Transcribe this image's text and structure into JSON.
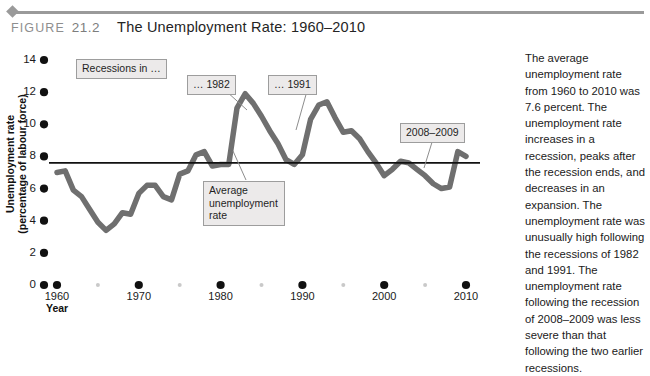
{
  "header": {
    "figure_word": "FIGURE",
    "figure_number": "21.2",
    "title": "The Unemployment Rate: 1960–2010"
  },
  "chart_data": {
    "type": "line",
    "title": "The Unemployment Rate: 1960–2010",
    "xlabel": "Year",
    "ylabel": "Unemployment rate (percentage of labour force)",
    "xlim": [
      1960,
      2010
    ],
    "ylim": [
      0,
      14
    ],
    "grid": false,
    "legend": "none",
    "ytick_labels": [
      "0",
      "2",
      "4",
      "6",
      "8",
      "10",
      "12",
      "14"
    ],
    "ytick_values": [
      0,
      2,
      4,
      6,
      8,
      10,
      12,
      14
    ],
    "xtick_labels": [
      "1960",
      "1970",
      "1980",
      "1990",
      "2000",
      "2010"
    ],
    "xtick_values": [
      1960,
      1970,
      1980,
      1990,
      2000,
      2010
    ],
    "xminor_values": [
      1965,
      1975,
      1985,
      1995,
      2005
    ],
    "series": [
      {
        "name": "Unemployment rate",
        "color": "#6f6f6f",
        "x": [
          1960,
          1961,
          1962,
          1963,
          1964,
          1965,
          1966,
          1967,
          1968,
          1969,
          1970,
          1971,
          1972,
          1973,
          1974,
          1975,
          1976,
          1977,
          1978,
          1979,
          1980,
          1981,
          1982,
          1983,
          1984,
          1985,
          1986,
          1987,
          1988,
          1989,
          1990,
          1991,
          1992,
          1993,
          1994,
          1995,
          1996,
          1997,
          1998,
          1999,
          2000,
          2001,
          2002,
          2003,
          2004,
          2005,
          2006,
          2007,
          2008,
          2009,
          2010
        ],
        "y": [
          7.0,
          7.1,
          5.9,
          5.5,
          4.7,
          3.9,
          3.4,
          3.8,
          4.5,
          4.4,
          5.7,
          6.2,
          6.2,
          5.5,
          5.3,
          6.9,
          7.1,
          8.1,
          8.3,
          7.4,
          7.5,
          7.5,
          11.0,
          11.9,
          11.3,
          10.5,
          9.6,
          8.8,
          7.8,
          7.5,
          8.1,
          10.3,
          11.2,
          11.4,
          10.4,
          9.5,
          9.6,
          9.1,
          8.3,
          7.6,
          6.8,
          7.2,
          7.7,
          7.6,
          7.2,
          6.8,
          6.3,
          6.0,
          6.1,
          8.3,
          8.0
        ],
        "line_width": 5.5
      },
      {
        "name": "Average unemployment rate",
        "color": "#111111",
        "type": "hline",
        "value": 7.6,
        "line_width": 1.6
      }
    ],
    "annotations": [
      {
        "name": "recessions-label",
        "text": "Recessions in …"
      },
      {
        "name": "recession-1982-label",
        "text": "… 1982"
      },
      {
        "name": "recession-1991-label",
        "text": "… 1991"
      },
      {
        "name": "recession-2008-2009-label",
        "text": "2008–2009"
      },
      {
        "name": "average-rate-label",
        "text": "Average unemployment rate"
      }
    ]
  },
  "side_panel": {
    "paragraph": "The average unemployment rate from 1960 to 2010 was 7.6 percent. The unemployment rate increases in a recession, peaks after the recession ends, and decreases in an expansion. The unemployment rate was unusually high following the recessions of 1982 and 1991. The unemployment rate following the recession of 2008–2009 was less severe than that following the two earlier recessions."
  }
}
